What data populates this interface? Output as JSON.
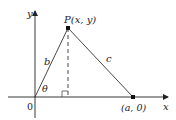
{
  "diagram": {
    "type": "geometry-triangle-on-axes",
    "axes": {
      "x_label": "x",
      "y_label": "y",
      "origin_label": "0"
    },
    "points": {
      "P": {
        "label": "P(x, y)"
      },
      "A": {
        "label": "(a, 0)"
      }
    },
    "sides": {
      "b": "b",
      "c": "c"
    },
    "angle": "θ",
    "colors": {
      "line": "#222222",
      "background": "#ffffff"
    }
  }
}
